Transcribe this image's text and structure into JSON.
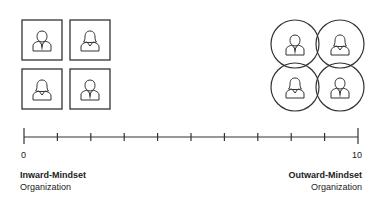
{
  "scale": {
    "min_label": "0",
    "max_label": "10",
    "min": 0,
    "max": 10,
    "tick_count": 11
  },
  "left": {
    "title": "Inward-Mindset",
    "subtitle": "Organization",
    "shape": "squares",
    "people": [
      "man",
      "woman",
      "woman",
      "man"
    ]
  },
  "right": {
    "title": "Outward-Mindset",
    "subtitle": "Organization",
    "shape": "overlapping-circles",
    "people": [
      "man",
      "woman",
      "woman",
      "man"
    ]
  },
  "colors": {
    "stroke": "#333333",
    "text": "#222222",
    "background": "#ffffff"
  }
}
